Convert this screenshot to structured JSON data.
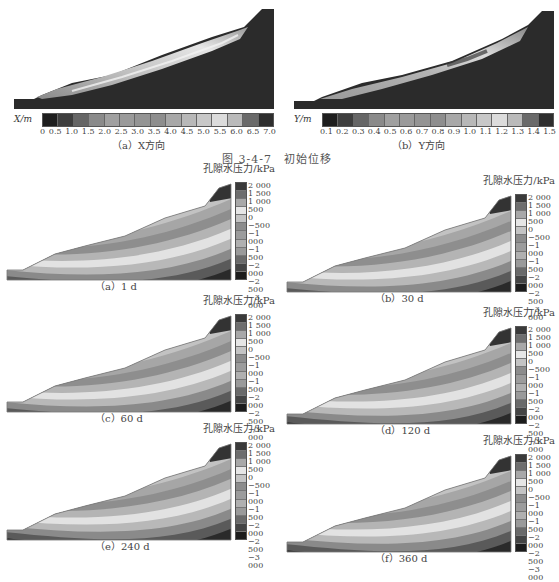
{
  "figure_347": {
    "title": "图 3-4-7　初始位移",
    "panel_a": {
      "caption": "（a）X方向",
      "axis_label": "X/m",
      "ticks": [
        "0",
        "0.5",
        "1.0",
        "1.5",
        "2.0",
        "2.5",
        "3.0",
        "3.5",
        "4.0",
        "4.5",
        "5.0",
        "5.5",
        "6.0",
        "6.5",
        "7.0"
      ],
      "colors": [
        "#1e1e1e",
        "#3e3e3e",
        "#666666",
        "#8a8a8a",
        "#a0a0a0",
        "#9a9a9a",
        "#949494",
        "#8e8e8e",
        "#a8a8a8",
        "#b8b8b8",
        "#c8c8c8",
        "#dcdcdc",
        "#bababa",
        "#6a6a6a",
        "#2e2e2e"
      ]
    },
    "panel_b": {
      "caption": "（b）Y方向",
      "axis_label": "Y/m",
      "ticks": [
        "0.1",
        "0.2",
        "0.3",
        "0.4",
        "0.5",
        "0.6",
        "0.7",
        "0.8",
        "0.9",
        "1.0",
        "1.1",
        "1.2",
        "1.3",
        "1.4",
        "1.5"
      ],
      "colors": [
        "#1e1e1e",
        "#3e3e3e",
        "#666666",
        "#8a8a8a",
        "#a0a0a0",
        "#9a9a9a",
        "#949494",
        "#8e8e8e",
        "#a8a8a8",
        "#b8b8b8",
        "#c8c8c8",
        "#dcdcdc",
        "#bababa",
        "#6a6a6a",
        "#2e2e2e"
      ]
    }
  },
  "pore_pressure": {
    "unit_label": "孔隙水压力/kPa",
    "legend_ticks": [
      "2 000",
      "1 500",
      "1 000",
      "500",
      "0",
      "−500",
      "−1 000",
      "−1 500",
      "−2 000",
      "−2 500",
      "−3 000"
    ],
    "legend_colors": [
      "#3a3a3a",
      "#6e6e6e",
      "#a8a8a8",
      "#e6e6e6",
      "#c4c4c4",
      "#8c8c8c",
      "#9c9c9c",
      "#b0b0b0",
      "#9a9a9a",
      "#6a6a6a",
      "#444444",
      "#1c1c1c"
    ],
    "panels": [
      {
        "caption": "（a）1 d"
      },
      {
        "caption": "（b）30 d"
      },
      {
        "caption": "（c）60 d"
      },
      {
        "caption": "（d）120 d"
      },
      {
        "caption": "（e）240 d"
      },
      {
        "caption": "（f）360 d"
      }
    ]
  },
  "chart_data": [
    {
      "type": "heatmap",
      "title": "(a) X方向 — 初始位移",
      "colorbar_label": "X/m",
      "colorbar_ticks": [
        0,
        0.5,
        1.0,
        1.5,
        2.0,
        2.5,
        3.0,
        3.5,
        4.0,
        4.5,
        5.0,
        5.5,
        6.0,
        6.5,
        7.0
      ],
      "range": [
        0,
        7.0
      ]
    },
    {
      "type": "heatmap",
      "title": "(b) Y方向 — 初始位移",
      "colorbar_label": "Y/m",
      "colorbar_ticks": [
        0.1,
        0.2,
        0.3,
        0.4,
        0.5,
        0.6,
        0.7,
        0.8,
        0.9,
        1.0,
        1.1,
        1.2,
        1.3,
        1.4,
        1.5
      ],
      "range": [
        0.1,
        1.5
      ]
    },
    {
      "type": "heatmap",
      "title": "孔隙水压力 contours at 1 d, 30 d, 60 d, 120 d, 240 d, 360 d",
      "colorbar_label": "孔隙水压力/kPa",
      "colorbar_ticks": [
        2000,
        1500,
        1000,
        500,
        0,
        -500,
        -1000,
        -1500,
        -2000,
        -2500,
        -3000
      ],
      "range": [
        -3000,
        2000
      ],
      "times_days": [
        1,
        30,
        60,
        120,
        240,
        360
      ]
    }
  ]
}
